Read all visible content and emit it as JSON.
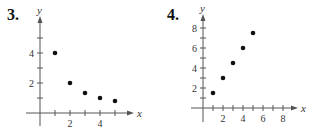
{
  "chart_data": [
    {
      "type": "scatter",
      "title": "3.",
      "xlabel": "x",
      "ylabel": "y",
      "x": [
        1,
        2,
        3,
        4,
        5
      ],
      "y": [
        4,
        2,
        1.33,
        1,
        0.8
      ],
      "x_tick_labels": [
        "2",
        "4"
      ],
      "y_tick_labels": [
        "2",
        "4"
      ],
      "xlim": [
        0,
        5.5
      ],
      "ylim": [
        0,
        5.5
      ],
      "grid": false,
      "legend": null
    },
    {
      "type": "scatter",
      "title": "4.",
      "xlabel": "x",
      "ylabel": "y",
      "x": [
        1,
        2,
        3,
        4,
        5
      ],
      "y": [
        1.5,
        3,
        4.5,
        6,
        7.5
      ],
      "x_tick_labels": [
        "2",
        "4",
        "6",
        "8"
      ],
      "y_tick_labels": [
        "2",
        "4",
        "6",
        "8"
      ],
      "xlim": [
        0,
        8.5
      ],
      "ylim": [
        0,
        8.5
      ],
      "grid": false,
      "legend": null
    }
  ],
  "plots": [
    {
      "number": "3.",
      "origin": [
        40,
        113
      ],
      "scale": [
        15,
        15
      ],
      "x_ticks": [
        1,
        2,
        3,
        4,
        5
      ],
      "y_ticks": [
        1,
        2,
        3,
        4,
        5
      ],
      "x_labels": [
        {
          "v": 2,
          "t": "2"
        },
        {
          "v": 4,
          "t": "4"
        }
      ],
      "y_labels": [
        {
          "v": 2,
          "t": "2"
        },
        {
          "v": 4,
          "t": "4"
        }
      ],
      "x_end": 130,
      "y_end": 20,
      "x_min": 26,
      "y_min": 126,
      "axis_x_label": "x",
      "axis_y_label": "y"
    },
    {
      "number": "4.",
      "origin": [
        203,
        108
      ],
      "scale": [
        10,
        10
      ],
      "x_ticks": [
        1,
        2,
        3,
        4,
        5,
        6,
        7,
        8
      ],
      "y_ticks": [
        1,
        2,
        3,
        4,
        5,
        6,
        7,
        8
      ],
      "x_labels": [
        {
          "v": 2,
          "t": "2"
        },
        {
          "v": 4,
          "t": "4"
        },
        {
          "v": 6,
          "t": "6"
        },
        {
          "v": 8,
          "t": "8"
        }
      ],
      "y_labels": [
        {
          "v": 2,
          "t": "2"
        },
        {
          "v": 4,
          "t": "4"
        },
        {
          "v": 6,
          "t": "6"
        },
        {
          "v": 8,
          "t": "8"
        }
      ],
      "x_end": 294,
      "y_end": 18,
      "x_min": 191,
      "y_min": 122,
      "axis_x_label": "x",
      "axis_y_label": "y"
    }
  ]
}
